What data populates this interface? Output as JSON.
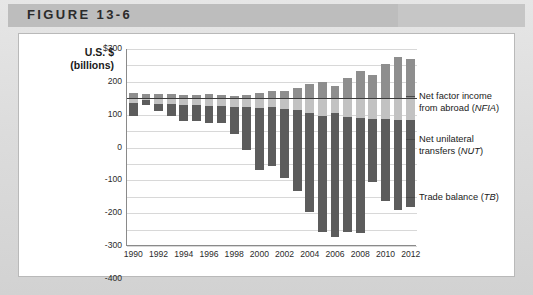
{
  "header": {
    "figure_label": "FIGURE 13-6"
  },
  "chart_data": {
    "type": "bar",
    "stacked": true,
    "title": "",
    "xlabel": "",
    "ylabel": "U.S. $ (billions)",
    "ylabel_line1": "U.S. $",
    "ylabel_line2": "(billions)",
    "ylim": [
      -900,
      300
    ],
    "ytick_values": [
      300,
      200,
      100,
      0,
      -100,
      -200,
      -300,
      -400,
      -500,
      -600,
      -700,
      -800,
      -900
    ],
    "ytick_labels": [
      "$300",
      "200",
      "100",
      "0",
      "-100",
      "-200",
      "-300",
      "-400",
      "-500",
      "-600",
      "-700",
      "-800",
      "-900"
    ],
    "grid": true,
    "legend_position": "right",
    "categories": [
      1990,
      1991,
      1992,
      1993,
      1994,
      1995,
      1996,
      1997,
      1998,
      1999,
      2000,
      2001,
      2002,
      2003,
      2004,
      2005,
      2006,
      2007,
      2008,
      2009,
      2010,
      2011,
      2012
    ],
    "xtick_labels": [
      "1990",
      "1992",
      "1994",
      "1996",
      "1998",
      "2000",
      "2002",
      "2004",
      "2006",
      "2008",
      "2010",
      "2012"
    ],
    "xtick_values": [
      1990,
      1992,
      1994,
      1996,
      1998,
      2000,
      2002,
      2004,
      2006,
      2008,
      2010,
      2012
    ],
    "series": [
      {
        "name": "Net factor income from abroad (NFIA)",
        "abbr": "NFIA",
        "color": "#8e8e8e",
        "values": [
          29,
          25,
          23,
          25,
          18,
          21,
          24,
          20,
          13,
          20,
          32,
          47,
          46,
          65,
          89,
          96,
          72,
          123,
          165,
          140,
          207,
          250,
          238
        ]
      },
      {
        "name": "Net unilateral transfers (NUT)",
        "abbr": "NUT",
        "color": "#c2c2c2",
        "values": [
          -27,
          -10,
          -36,
          -38,
          -41,
          -44,
          -45,
          -45,
          -54,
          -51,
          -59,
          -52,
          -65,
          -72,
          -88,
          -106,
          -92,
          -116,
          -122,
          -125,
          -129,
          -133,
          -130
        ]
      },
      {
        "name": "Trade balance (TB)",
        "abbr": "TB",
        "color": "#5c5c5c",
        "values": [
          -80,
          -32,
          -40,
          -70,
          -98,
          -96,
          -104,
          -108,
          -166,
          -263,
          -377,
          -362,
          -421,
          -495,
          -607,
          -711,
          -754,
          -700,
          -698,
          -384,
          -494,
          -548,
          -535
        ]
      }
    ],
    "legend": [
      {
        "label_line1": "Net factor income",
        "label_line2": "from abroad (",
        "abbr": "NFIA",
        "label_tail": ")"
      },
      {
        "label_line1": "Net unilateral",
        "label_line2": "transfers (",
        "abbr": "NUT",
        "label_tail": ")"
      },
      {
        "label_line1": "Trade balance (",
        "label_line2": "",
        "abbr": "TB",
        "label_tail": ")"
      }
    ]
  }
}
